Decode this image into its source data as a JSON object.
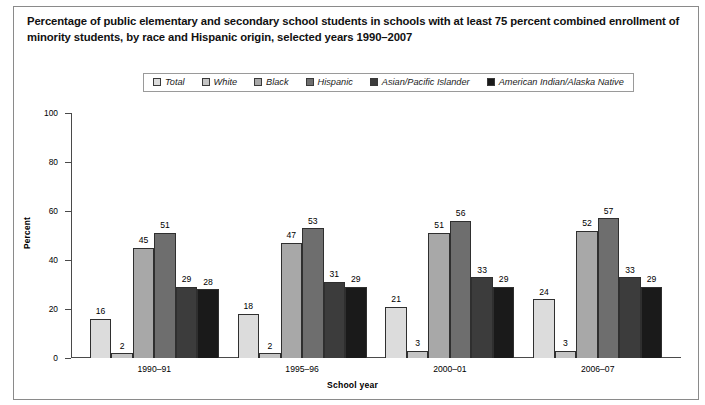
{
  "title": "Percentage of public elementary and secondary school students in schools with at least 75 percent combined enrollment of minority students, by race and Hispanic origin, selected years 1990–2007",
  "legend": {
    "items": [
      {
        "label": "Total",
        "color": "#dcdcdc"
      },
      {
        "label": "White",
        "color": "#c4c4c4"
      },
      {
        "label": "Black",
        "color": "#a8a8a8"
      },
      {
        "label": "Hispanic",
        "color": "#6e6e6e"
      },
      {
        "label": "Asian/Pacific Islander",
        "color": "#3c3c3c"
      },
      {
        "label": "American Indian/Alaska Native",
        "color": "#1a1a1a"
      }
    ]
  },
  "chart_data": {
    "type": "bar",
    "title": "Percentage of public elementary and secondary school students in schools with at least 75 percent combined enrollment of minority students, by race and Hispanic origin, selected years 1990–2007",
    "xlabel": "School year",
    "ylabel": "Percent",
    "ylim": [
      0,
      100
    ],
    "yticks": [
      0,
      20,
      40,
      60,
      80,
      100
    ],
    "ytick_labels": [
      "0",
      "20",
      "40",
      "60",
      "80",
      "100"
    ],
    "grid": false,
    "legend_position": "top-center",
    "categories": [
      "1990–91",
      "1995–96",
      "2000–01",
      "2006–07"
    ],
    "series": [
      {
        "name": "Total",
        "color": "#dcdcdc",
        "values": [
          16,
          18,
          21,
          24
        ]
      },
      {
        "name": "White",
        "color": "#c4c4c4",
        "values": [
          2,
          2,
          3,
          3
        ]
      },
      {
        "name": "Black",
        "color": "#a8a8a8",
        "values": [
          45,
          47,
          51,
          52
        ]
      },
      {
        "name": "Hispanic",
        "color": "#6e6e6e",
        "values": [
          51,
          53,
          56,
          57
        ]
      },
      {
        "name": "Asian/Pacific Islander",
        "color": "#3c3c3c",
        "values": [
          29,
          31,
          33,
          33
        ]
      },
      {
        "name": "American Indian/Alaska Native",
        "color": "#1a1a1a",
        "values": [
          28,
          29,
          29,
          29
        ]
      }
    ]
  }
}
